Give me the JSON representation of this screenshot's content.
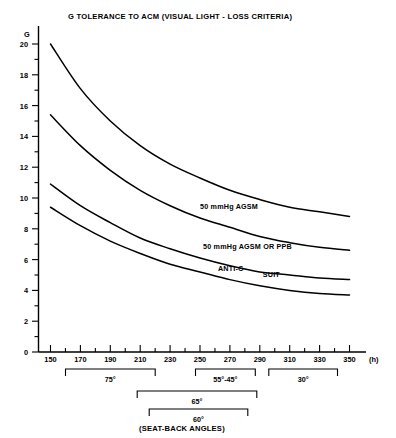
{
  "chart_data": {
    "type": "line",
    "title": "G TOLERANCE TO ACM (VISUAL LIGHT - LOSS CRITERIA)",
    "xlabel": "(h)",
    "ylabel": "G",
    "xlim": [
      140,
      360
    ],
    "ylim": [
      0,
      20
    ],
    "grid": false,
    "legend_position": "inline-annotations",
    "x_ticks": [
      150,
      170,
      190,
      210,
      230,
      250,
      270,
      290,
      310,
      330,
      350
    ],
    "x_tick_labels": [
      "150",
      "170",
      "190",
      "210",
      "230",
      "250",
      "270",
      "290",
      "310",
      "330",
      "350"
    ],
    "x_minor_ticks": [
      160,
      180,
      200,
      220,
      240,
      260,
      280,
      300,
      320,
      340
    ],
    "y_ticks": [
      0,
      2,
      4,
      6,
      8,
      10,
      12,
      14,
      16,
      18,
      20
    ],
    "y_tick_labels": [
      "0",
      "2",
      "4",
      "6",
      "8",
      "10",
      "12",
      "14",
      "16",
      "18",
      "20"
    ],
    "y_minor_ticks": [
      1,
      3,
      5,
      7,
      9,
      11,
      13,
      15,
      17,
      19
    ],
    "x": [
      150,
      170,
      190,
      210,
      230,
      250,
      270,
      290,
      310,
      330,
      350
    ],
    "series": [
      {
        "name": "unlabeled-top-curve",
        "values": [
          20.0,
          17.1,
          15.0,
          13.4,
          12.2,
          11.3,
          10.5,
          9.9,
          9.4,
          9.1,
          8.8
        ]
      },
      {
        "name": "50 mmHg AGSM",
        "values": [
          15.4,
          13.4,
          11.8,
          10.5,
          9.5,
          8.7,
          8.1,
          7.5,
          7.1,
          6.8,
          6.6
        ]
      },
      {
        "name": "50 mmHg AGSM OR PPB",
        "values": [
          10.9,
          9.5,
          8.4,
          7.4,
          6.7,
          6.1,
          5.6,
          5.2,
          5.0,
          4.8,
          4.7
        ]
      },
      {
        "name": "ANTI-G SUIT",
        "values": [
          9.4,
          8.2,
          7.2,
          6.4,
          5.7,
          5.2,
          4.7,
          4.3,
          4.0,
          3.8,
          3.7
        ]
      }
    ],
    "annotations": [
      {
        "text": "50 mmHg AGSM",
        "x": 250,
        "y": 9.4
      },
      {
        "text": "50 mmHg AGSM OR PPB",
        "x": 252,
        "y": 6.8
      },
      {
        "text": "ANTI-G",
        "x": 262,
        "y": 5.4
      },
      {
        "text": "SUIT",
        "x": 292,
        "y": 5.0
      }
    ],
    "brackets": [
      {
        "label": "75°",
        "from": 160,
        "to": 220,
        "level": 1
      },
      {
        "label": "55°-45°",
        "from": 247,
        "to": 287,
        "level": 1
      },
      {
        "label": "30°",
        "from": 296,
        "to": 342,
        "level": 1
      },
      {
        "label": "65°",
        "from": 208,
        "to": 288,
        "level": 2
      },
      {
        "label": "60°",
        "from": 216,
        "to": 282,
        "level": 3
      }
    ],
    "bracket_caption": "(SEAT-BACK ANGLES)"
  },
  "colors": {
    "ink": "#000000",
    "background": "#ffffff"
  }
}
